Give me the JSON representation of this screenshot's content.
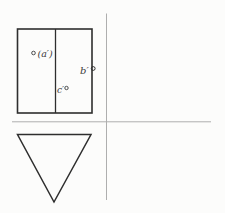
{
  "figure": {
    "type": "descriptive-geometry-projection",
    "labels": {
      "a": "(a′)",
      "b": "b′",
      "c": "c′"
    },
    "markers": {
      "a": "open-circle",
      "b": "open-circle",
      "c": "open-circle"
    },
    "colors": {
      "background": "#fcfcfb",
      "shape_stroke": "#2e2e2e",
      "axis_line": "#aeaeae",
      "label_text": "#3b3b3b"
    }
  }
}
